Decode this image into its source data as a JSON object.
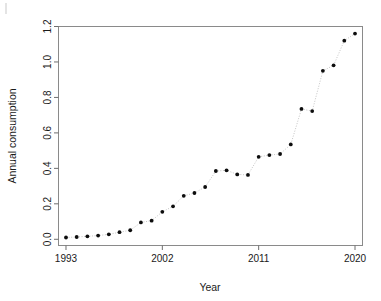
{
  "figure": {
    "artifact_mark": "|",
    "background": "#ffffff"
  },
  "axes": {
    "x": {
      "title": "Year",
      "tick_labels": [
        "1993",
        "2002",
        "2011",
        "2020"
      ],
      "tick_values": [
        1993,
        2002,
        2011,
        2020
      ],
      "range": [
        1992.3,
        2020.7
      ]
    },
    "y": {
      "title": "Annual consumption",
      "tick_labels": [
        "0.0",
        "0.2",
        "0.4",
        "0.6",
        "0.8",
        "1.0",
        "1.2"
      ],
      "tick_values": [
        0.0,
        0.2,
        0.4,
        0.6,
        0.8,
        1.0,
        1.2
      ],
      "range": [
        -0.035,
        1.2
      ]
    }
  },
  "chart_data": {
    "type": "scatter",
    "title": "",
    "xlabel": "Year",
    "ylabel": "Annual consumption",
    "xlim": [
      1992.3,
      2020.7
    ],
    "ylim": [
      -0.035,
      1.2
    ],
    "grid": false,
    "legend": "none",
    "marker": "filled-circle",
    "marker_color": "#0d0d0d",
    "connector_style": "dotted",
    "connector_color": "#b9b9b9",
    "x": [
      1993,
      1994,
      1995,
      1996,
      1997,
      1998,
      1999,
      2000,
      2001,
      2002,
      2003,
      2004,
      2005,
      2006,
      2007,
      2008,
      2009,
      2010,
      2011,
      2012,
      2013,
      2014,
      2015,
      2016,
      2017,
      2018,
      2019,
      2020
    ],
    "values": [
      0.01,
      0.013,
      0.017,
      0.021,
      0.028,
      0.04,
      0.051,
      0.095,
      0.105,
      0.155,
      0.186,
      0.245,
      0.261,
      0.295,
      0.385,
      0.389,
      0.366,
      0.363,
      0.465,
      0.475,
      0.481,
      0.535,
      0.735,
      0.723,
      0.95,
      0.981,
      1.12,
      1.16
    ],
    "series": [
      {
        "name": "Annual consumption",
        "values": [
          0.01,
          0.013,
          0.017,
          0.021,
          0.028,
          0.04,
          0.051,
          0.095,
          0.105,
          0.155,
          0.186,
          0.245,
          0.261,
          0.295,
          0.385,
          0.389,
          0.366,
          0.363,
          0.465,
          0.475,
          0.481,
          0.535,
          0.735,
          0.723,
          0.95,
          0.981,
          1.12,
          1.16
        ]
      }
    ]
  }
}
